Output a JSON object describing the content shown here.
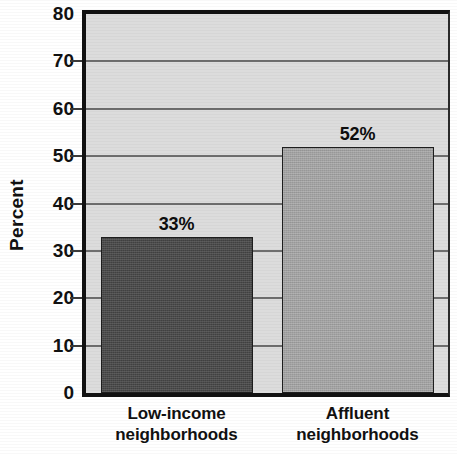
{
  "chart_data": {
    "type": "bar",
    "title": "",
    "subtitle": "",
    "xlabel": "",
    "ylabel": "Percent",
    "ylim": [
      0,
      80
    ],
    "ytick_step": 10,
    "yticks": [
      80,
      70,
      60,
      50,
      40,
      30,
      20,
      10,
      0
    ],
    "ytick_labels": [
      "80",
      "70",
      "60",
      "50",
      "40",
      "30",
      "20",
      "10",
      "0"
    ],
    "grid": true,
    "grid_axis": "y",
    "legend": false,
    "legend_position": "none",
    "categories": [
      "Low-income neighborhoods",
      "Affluent neighborhoods"
    ],
    "category_lines": [
      [
        "Low-income",
        "neighborhoods"
      ],
      [
        "Affluent",
        "neighborhoods"
      ]
    ],
    "values": [
      33,
      52
    ],
    "value_labels": [
      "33%",
      "52%"
    ],
    "bar_colors": [
      "#484848",
      "#a8a8a8"
    ],
    "series": [
      {
        "name": "Percent",
        "values": [
          33,
          52
        ]
      }
    ],
    "annotations": []
  },
  "style": {
    "plot_background": "#dcdcdc",
    "page_background": "#ffffff",
    "axis_color": "#111111",
    "gridline_color": "#6e6e6e",
    "text_color": "#111111"
  }
}
